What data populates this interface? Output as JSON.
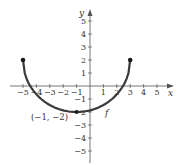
{
  "chart_data": {
    "type": "line",
    "title": "",
    "xlabel": "x",
    "ylabel": "y",
    "xlim": [
      -5.5,
      5.5
    ],
    "ylim": [
      -5.5,
      5.5
    ],
    "grid": false,
    "x_ticks": [
      -5,
      -4,
      -3,
      -2,
      -1,
      1,
      2,
      3,
      4,
      5
    ],
    "y_ticks": [
      -5,
      -4,
      -3,
      -2,
      -1,
      1,
      2,
      3,
      4,
      5
    ],
    "x_tick_labels": [
      "−5",
      "−4",
      "−3",
      "−2",
      "−1",
      "1",
      "2",
      "3",
      "4",
      "5"
    ],
    "y_tick_labels": [
      "−5",
      "−4",
      "−3",
      "−2",
      "−1",
      "1",
      "2",
      "3",
      "4",
      "5"
    ],
    "series": [
      {
        "name": "f",
        "shape": "lower semicircle",
        "center": [
          -1,
          2
        ],
        "radius": 4,
        "endpoints": [
          [
            -5,
            2
          ],
          [
            3,
            2
          ]
        ],
        "closed_endpoints": true,
        "color": "#3a3a3a"
      }
    ],
    "annotations": [
      {
        "text": "(−1, −2)",
        "point": [
          -1,
          -2
        ]
      },
      {
        "text": "f",
        "label_for": "f"
      }
    ]
  },
  "labels": {
    "x_axis": "x",
    "y_axis": "y",
    "function": "f",
    "point": "(−1, −2)"
  }
}
